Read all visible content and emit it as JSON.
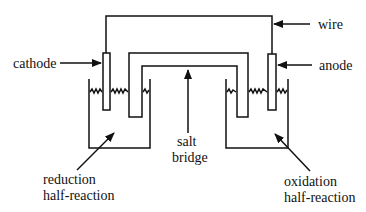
{
  "diagram": {
    "labels": {
      "wire": "wire",
      "cathode": "cathode",
      "anode": "anode",
      "salt_bridge_line1": "salt",
      "salt_bridge_line2": "bridge",
      "reduction_line1": "reduction",
      "reduction_line2": "half-reaction",
      "oxidation_line1": "oxidation",
      "oxidation_line2": "half-reaction"
    },
    "components": [
      "wire",
      "cathode",
      "anode",
      "salt bridge",
      "left beaker (reduction half-cell)",
      "right beaker (oxidation half-cell)"
    ],
    "colors": {
      "line": "#111111",
      "background": "#ffffff"
    }
  }
}
